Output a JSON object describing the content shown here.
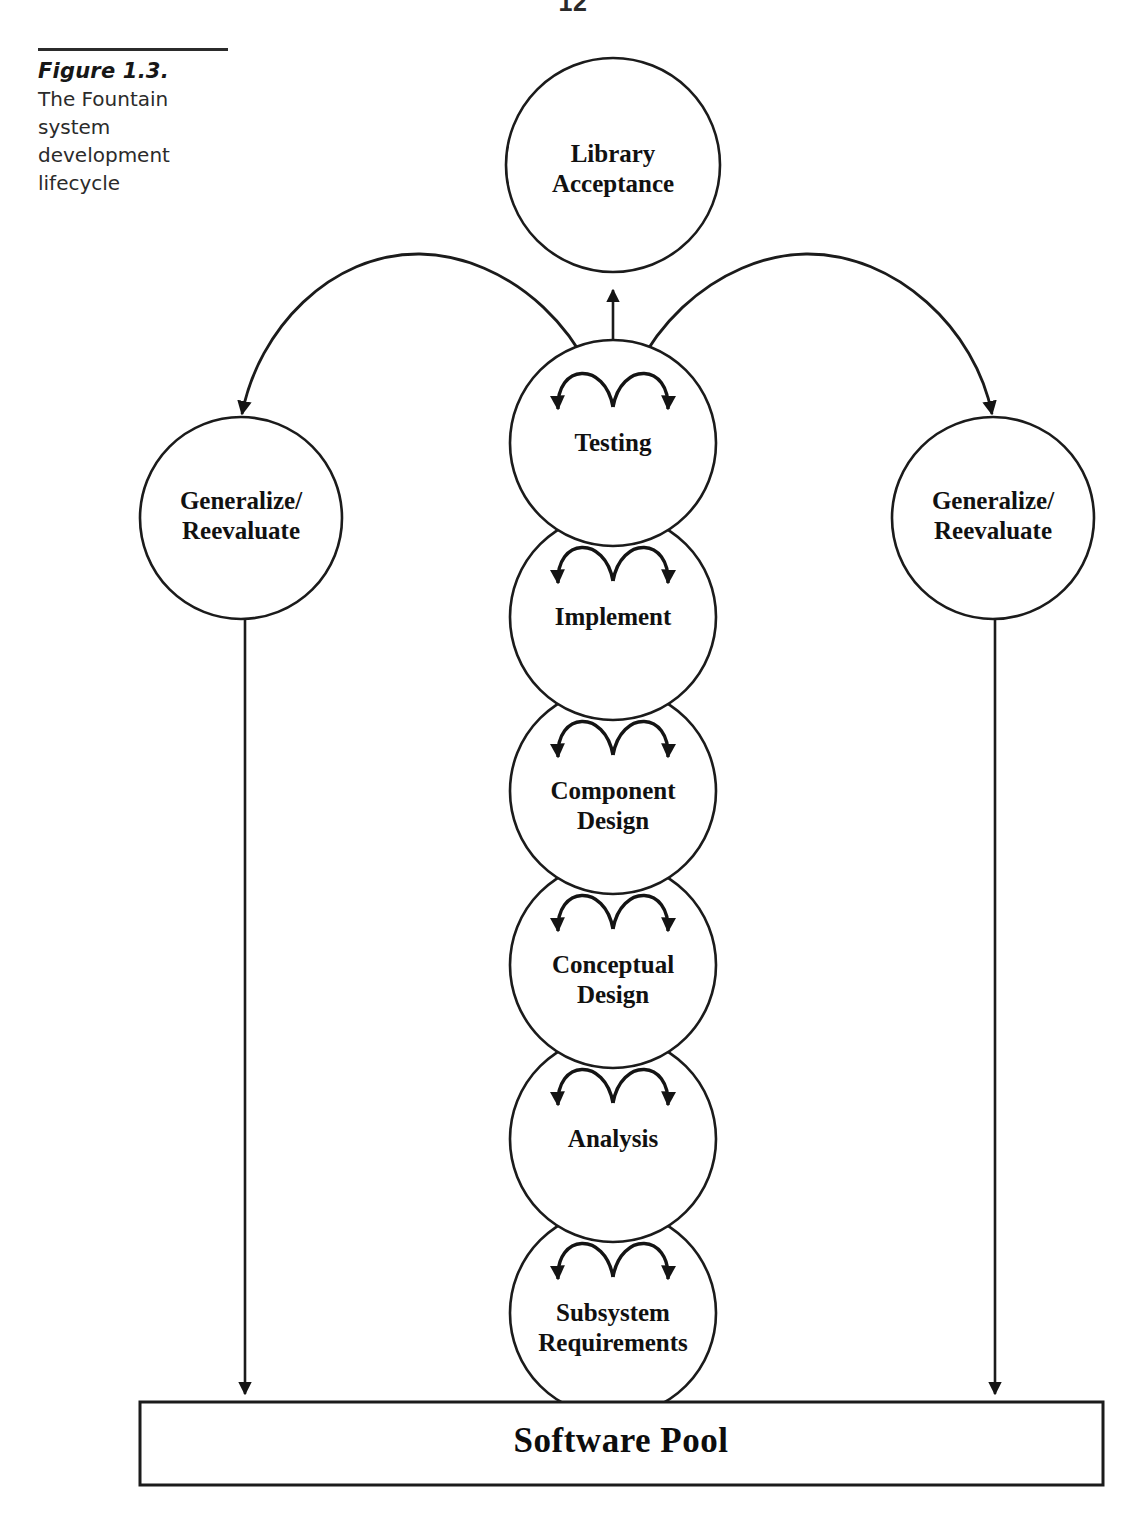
{
  "page": {
    "folio": "12",
    "background": "#ffffff",
    "ink": "#1b1b1b"
  },
  "caption": {
    "title": "Figure 1.3.",
    "description": "The Fountain system development lifecycle"
  },
  "diagram": {
    "type": "flow-diagram",
    "name": "fountain-system-development-lifecycle",
    "top_node": {
      "id": "library-acceptance",
      "label_line1": "Library",
      "label_line2": "Acceptance",
      "cx": 613,
      "cy": 165,
      "r": 107
    },
    "side_nodes": [
      {
        "id": "generalize-reevaluate-left",
        "label_line1": "Generalize/",
        "label_line2": "Reevaluate",
        "cx": 241,
        "cy": 518,
        "r": 101
      },
      {
        "id": "generalize-reevaluate-right",
        "label_line1": "Generalize/",
        "label_line2": "Reevaluate",
        "cx": 993,
        "cy": 518,
        "r": 101
      }
    ],
    "stack_nodes": [
      {
        "id": "testing",
        "label_line1": "Testing",
        "label_line2": "",
        "cx": 613,
        "cy": 443,
        "r": 103
      },
      {
        "id": "implement",
        "label_line1": "Implement",
        "label_line2": "",
        "cx": 613,
        "cy": 617,
        "r": 103
      },
      {
        "id": "component-design",
        "label_line1": "Component",
        "label_line2": "Design",
        "cx": 613,
        "cy": 791,
        "r": 103
      },
      {
        "id": "conceptual-design",
        "label_line1": "Conceptual",
        "label_line2": "Design",
        "cx": 613,
        "cy": 965,
        "r": 103
      },
      {
        "id": "analysis",
        "label_line1": "Analysis",
        "label_line2": "",
        "cx": 613,
        "cy": 1139,
        "r": 103
      },
      {
        "id": "subsystem-requirements",
        "label_line1": "Subsystem",
        "label_line2": "Requirements",
        "cx": 613,
        "cy": 1313,
        "r": 103
      }
    ],
    "pool": {
      "id": "software-pool",
      "label": "Software Pool",
      "x": 140,
      "y": 1402,
      "width": 963,
      "height": 83
    },
    "connectors": [
      {
        "id": "spine-arrow-to-library",
        "from": "stack-spine",
        "to": "library-acceptance",
        "kind": "vertical-arrow-up"
      },
      {
        "id": "fountain-arc-left",
        "from": "testing",
        "to": "generalize-reevaluate-left",
        "kind": "curved-arc-arrow"
      },
      {
        "id": "fountain-arc-right",
        "from": "testing",
        "to": "generalize-reevaluate-right",
        "kind": "curved-arc-arrow"
      },
      {
        "id": "left-drop-to-pool",
        "from": "generalize-reevaluate-left",
        "to": "software-pool",
        "kind": "vertical-arrow-down"
      },
      {
        "id": "right-drop-to-pool",
        "from": "generalize-reevaluate-right",
        "to": "software-pool",
        "kind": "vertical-arrow-down"
      }
    ],
    "inner_arc_note": "each stack circle contains a pair of mirrored fountain arcs with arrowheads pointing down and outward"
  }
}
